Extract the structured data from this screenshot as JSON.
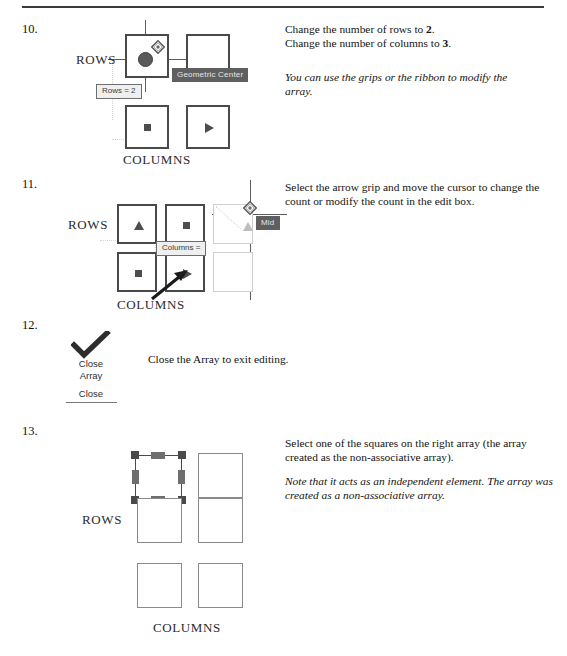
{
  "document": {
    "header_ghost_text": "",
    "rule_color": "#3a3a3a"
  },
  "steps": [
    {
      "number": "10.",
      "instructions": [
        {
          "text_before": "Change the number of rows to ",
          "bold": "2",
          "text_after": "."
        },
        {
          "text_before": "Change the number of columns to ",
          "bold": "3",
          "text_after": "."
        }
      ],
      "note": "You can use the grips or the ribbon to modify the array.",
      "diagram": {
        "rows_label": "ROWS",
        "columns_label": "COLUMNS",
        "tooltip_geometric_center": "Geometric Center",
        "tooltip_rows_edit": "Rows = 2",
        "cells": [
          {
            "glyph": "none"
          },
          {
            "glyph": "none"
          },
          {
            "glyph": "square"
          },
          {
            "glyph": "triangle-right"
          }
        ]
      }
    },
    {
      "number": "11.",
      "instructions": [
        {
          "text_before": "Select the arrow grip and move the cursor to change the count or modify the count in the edit box.",
          "bold": "",
          "text_after": ""
        }
      ],
      "note": "",
      "diagram": {
        "rows_label": "ROWS",
        "columns_label": "COLUMNS",
        "tooltip_columns_edit": "Columns =",
        "tooltip_grip": "Mid",
        "cells": [
          {
            "glyph": "triangle-up"
          },
          {
            "glyph": "square"
          },
          {
            "glyph": "square"
          },
          {
            "glyph": "triangle-right"
          }
        ]
      }
    },
    {
      "number": "12.",
      "instructions": [
        {
          "text_before": "Close the Array to exit editing.",
          "bold": "",
          "text_after": ""
        }
      ],
      "note": "",
      "ribbon": {
        "icon": "checkmark-icon",
        "button_line1": "Close",
        "button_line2": "Array",
        "panel_label": "Close"
      }
    },
    {
      "number": "13.",
      "instructions": [
        {
          "text_before": "Select one of the squares on the right array (the array created as the non-associative array).",
          "bold": "",
          "text_after": ""
        }
      ],
      "note": "Note that it acts as an independent element. The array was created as a non-associative array.",
      "diagram": {
        "rows_label": "ROWS",
        "columns_label": "COLUMNS",
        "grid_rows": 3,
        "grid_cols": 2,
        "selected_cell": "row1-col1"
      }
    }
  ]
}
